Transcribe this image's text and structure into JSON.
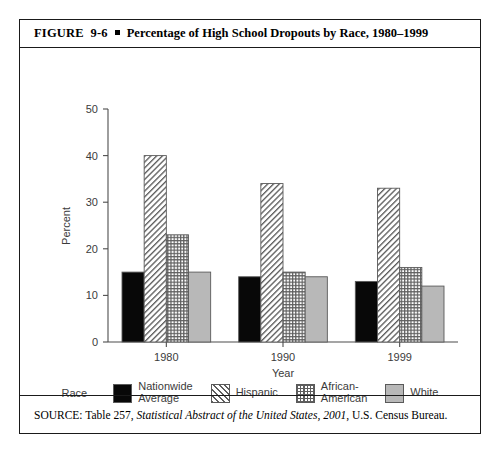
{
  "figure": {
    "label": "FIGURE  9-6",
    "bullet_icon": "square-bullet-icon",
    "title": "Percentage of High School Dropouts by Race, 1980–1999",
    "source_prefix": "SOURCE: Table 257, ",
    "source_italic": "Statistical Abstract of the United States, 2001",
    "source_suffix": ", U.S. Census Bureau."
  },
  "legend": {
    "title": "Race",
    "entries": [
      {
        "label": "Nationwide\nAverage",
        "pattern": "solid-black",
        "color": "#080808"
      },
      {
        "label": "Hispanic",
        "pattern": "diagonal-hatch",
        "color": "#5e5e5e"
      },
      {
        "label": "African-\nAmerican",
        "pattern": "cross-hatch",
        "color": "#5e5e5e"
      },
      {
        "label": "White",
        "pattern": "solid-gray",
        "color": "#b8b8b8"
      }
    ]
  },
  "chart_data": {
    "type": "bar",
    "title": "Percentage of High School Dropouts by Race, 1980–1999",
    "categories": [
      "1980",
      "1990",
      "1999"
    ],
    "series": [
      {
        "name": "Nationwide Average",
        "values": [
          15,
          14,
          13
        ]
      },
      {
        "name": "Hispanic",
        "values": [
          40,
          34,
          33
        ]
      },
      {
        "name": "African-American",
        "values": [
          23,
          15,
          16
        ]
      },
      {
        "name": "White",
        "values": [
          15,
          14,
          12
        ]
      }
    ],
    "xlabel": "Year",
    "ylabel": "Percent",
    "ylim": [
      0,
      50
    ],
    "yticks": [
      0,
      10,
      20,
      30,
      40,
      50
    ],
    "ytick_labels": [
      "0",
      "10",
      "20",
      "30",
      "40",
      "50"
    ],
    "grid": false,
    "legend_position": "bottom"
  }
}
